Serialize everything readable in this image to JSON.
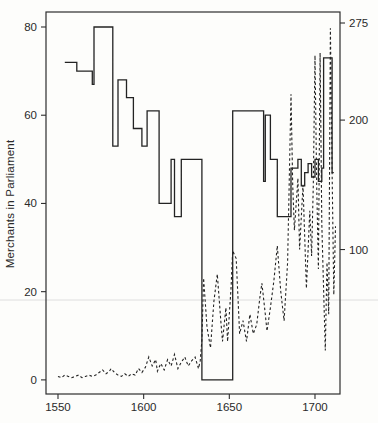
{
  "figure": {
    "background": "#fdfdfb",
    "line_color": "#232323",
    "frame_color": "#2e2e2e",
    "tick_label_color": "#2a2a2a",
    "artifact_line_color": "#dedede",
    "artifact_line_y": 300
  },
  "chart_data": {
    "type": "line",
    "title": "",
    "xlabel": "",
    "ylabel": "Merchants in Parliament",
    "y_right_label": "",
    "grid": false,
    "legend": "none",
    "x_ticks": [
      1550,
      1600,
      1650,
      1700
    ],
    "y_left_ticks": [
      0,
      20,
      40,
      60,
      80
    ],
    "y_right_ticks": [
      100,
      200,
      275
    ],
    "xlim": [
      1543,
      1714.6
    ],
    "y_left_lim": [
      -3.2,
      83.4
    ],
    "y_right_lim": [
      -11.6,
      283.5
    ],
    "series": [
      {
        "name": "merchants-in-parliament",
        "axis": "left",
        "style": "solid",
        "interpolation": "step-after",
        "points": [
          [
            1554,
            72
          ],
          [
            1561,
            70
          ],
          [
            1570,
            67
          ],
          [
            1571,
            80
          ],
          [
            1582,
            53
          ],
          [
            1585,
            68
          ],
          [
            1590,
            64
          ],
          [
            1594,
            57
          ],
          [
            1599,
            53
          ],
          [
            1602,
            61
          ],
          [
            1609,
            40
          ],
          [
            1616,
            50
          ],
          [
            1618,
            37
          ],
          [
            1622,
            50
          ],
          [
            1634,
            0
          ],
          [
            1652,
            61
          ],
          [
            1670,
            45
          ],
          [
            1671,
            60
          ],
          [
            1674,
            50
          ],
          [
            1678,
            37
          ],
          [
            1686,
            48
          ],
          [
            1690,
            50
          ],
          [
            1692,
            44
          ],
          [
            1694,
            47
          ],
          [
            1696,
            49
          ],
          [
            1698,
            46
          ],
          [
            1700,
            50
          ],
          [
            1702,
            45
          ],
          [
            1704,
            48
          ],
          [
            1705,
            73
          ],
          [
            1710,
            47
          ],
          [
            1711,
            47
          ]
        ]
      },
      {
        "name": "secondary-series",
        "axis": "right",
        "style": "dashed",
        "interpolation": "linear",
        "points": [
          [
            1550,
            2
          ],
          [
            1552,
            1
          ],
          [
            1554,
            3
          ],
          [
            1556,
            2
          ],
          [
            1558,
            1
          ],
          [
            1560,
            2
          ],
          [
            1562,
            3
          ],
          [
            1564,
            1
          ],
          [
            1566,
            2
          ],
          [
            1568,
            3
          ],
          [
            1570,
            2
          ],
          [
            1572,
            3
          ],
          [
            1574,
            5
          ],
          [
            1576,
            7
          ],
          [
            1578,
            4
          ],
          [
            1580,
            6
          ],
          [
            1581,
            8
          ],
          [
            1583,
            5
          ],
          [
            1585,
            3
          ],
          [
            1587,
            2
          ],
          [
            1589,
            4
          ],
          [
            1591,
            2
          ],
          [
            1593,
            4
          ],
          [
            1595,
            3
          ],
          [
            1597,
            8
          ],
          [
            1599,
            5
          ],
          [
            1601,
            9
          ],
          [
            1603,
            17
          ],
          [
            1605,
            10
          ],
          [
            1607,
            15
          ],
          [
            1608,
            6
          ],
          [
            1610,
            12
          ],
          [
            1612,
            7
          ],
          [
            1614,
            15
          ],
          [
            1616,
            10
          ],
          [
            1618,
            19
          ],
          [
            1620,
            8
          ],
          [
            1622,
            13
          ],
          [
            1624,
            17
          ],
          [
            1626,
            10
          ],
          [
            1628,
            14
          ],
          [
            1630,
            17
          ],
          [
            1632,
            8
          ],
          [
            1633,
            14
          ],
          [
            1634,
            30
          ],
          [
            1635,
            78
          ],
          [
            1637,
            40
          ],
          [
            1639,
            24
          ],
          [
            1641,
            60
          ],
          [
            1643,
            81
          ],
          [
            1645,
            45
          ],
          [
            1646,
            29
          ],
          [
            1648,
            55
          ],
          [
            1649,
            29
          ],
          [
            1651,
            70
          ],
          [
            1652,
            99
          ],
          [
            1654,
            93
          ],
          [
            1656,
            35
          ],
          [
            1658,
            45
          ],
          [
            1660,
            29
          ],
          [
            1662,
            50
          ],
          [
            1664,
            35
          ],
          [
            1666,
            42
          ],
          [
            1668,
            65
          ],
          [
            1669,
            74
          ],
          [
            1671,
            50
          ],
          [
            1672,
            37
          ],
          [
            1674,
            55
          ],
          [
            1676,
            76
          ],
          [
            1678,
            103
          ],
          [
            1680,
            68
          ],
          [
            1682,
            45
          ],
          [
            1684,
            90
          ],
          [
            1686,
            220
          ],
          [
            1687,
            150
          ],
          [
            1688,
            115
          ],
          [
            1690,
            155
          ],
          [
            1691,
            100
          ],
          [
            1693,
            150
          ],
          [
            1695,
            70
          ],
          [
            1697,
            130
          ],
          [
            1698,
            95
          ],
          [
            1699,
            150
          ],
          [
            1700,
            250
          ],
          [
            1701,
            150
          ],
          [
            1702,
            85
          ],
          [
            1703,
            252
          ],
          [
            1704,
            120
          ],
          [
            1706,
            22
          ],
          [
            1707,
            90
          ],
          [
            1708,
            50
          ],
          [
            1709,
            271
          ],
          [
            1710,
            160
          ],
          [
            1711,
            65
          ],
          [
            1712,
            118
          ]
        ]
      }
    ]
  }
}
